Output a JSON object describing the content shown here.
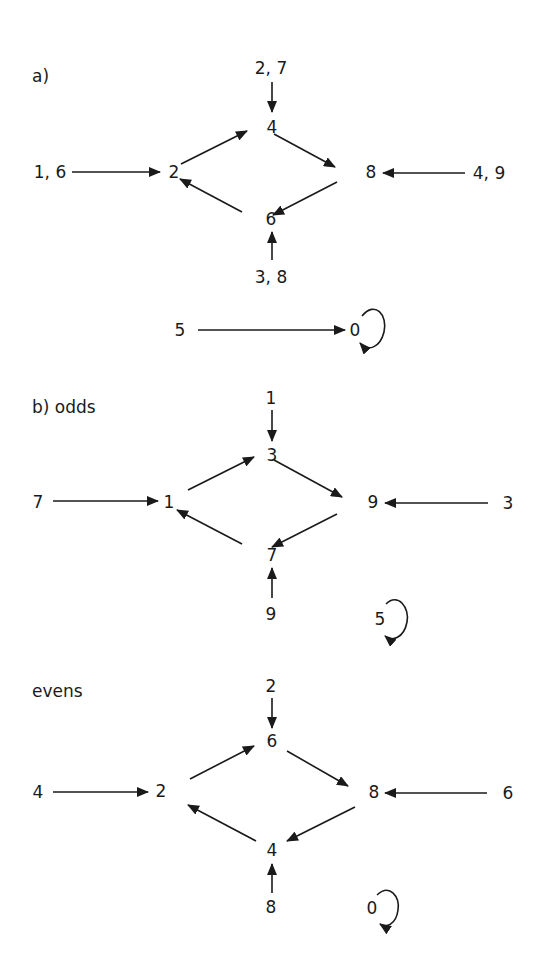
{
  "sections": {
    "a": {
      "label": "a)",
      "nodes": {
        "top": "4",
        "left": "2",
        "right": "8",
        "bottom": "6",
        "in_top": "2, 7",
        "in_left": "1, 6",
        "in_right": "4, 9",
        "in_bottom": "3, 8",
        "iso_src": "5",
        "iso_dst": "0"
      }
    },
    "b": {
      "label": "b)  odds",
      "nodes": {
        "top": "3",
        "left": "1",
        "right": "9",
        "bottom": "7",
        "in_top": "1",
        "in_left": "7",
        "in_right": "3",
        "in_bottom": "9",
        "self": "5"
      }
    },
    "c": {
      "label": "evens",
      "nodes": {
        "top": "6",
        "left": "2",
        "right": "8",
        "bottom": "4",
        "in_top": "2",
        "in_left": "4",
        "in_right": "6",
        "in_bottom": "8",
        "self": "0"
      }
    }
  },
  "edges": {
    "a": [
      [
        "1, 6",
        "2"
      ],
      [
        "2, 7",
        "4"
      ],
      [
        "4, 9",
        "8"
      ],
      [
        "3, 8",
        "6"
      ],
      [
        "2",
        "4"
      ],
      [
        "4",
        "8"
      ],
      [
        "8",
        "6"
      ],
      [
        "6",
        "2"
      ],
      [
        "5",
        "0"
      ],
      [
        "0",
        "0"
      ]
    ],
    "b": [
      [
        "7",
        "1"
      ],
      [
        "1",
        "3"
      ],
      [
        "3",
        "9"
      ],
      [
        "9",
        "7"
      ],
      [
        "7",
        "1"
      ],
      [
        "3",
        "9"
      ],
      [
        "9",
        "7"
      ],
      [
        "5",
        "5"
      ]
    ],
    "c": [
      [
        "4",
        "2"
      ],
      [
        "2",
        "6"
      ],
      [
        "6",
        "8"
      ],
      [
        "8",
        "4"
      ],
      [
        "4",
        "2"
      ],
      [
        "6",
        "8"
      ],
      [
        "8",
        "4"
      ],
      [
        "0",
        "0"
      ]
    ]
  },
  "colors": {
    "ink": "#1a1a1a",
    "background": "#ffffff"
  }
}
